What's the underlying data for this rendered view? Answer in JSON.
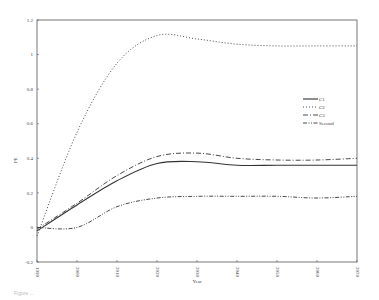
{
  "chart_data": {
    "type": "line",
    "title": "",
    "xlabel": "Year",
    "ylabel": "PE",
    "x": [
      1990,
      2000,
      2010,
      2020,
      2030,
      2040,
      2050,
      2060,
      2070
    ],
    "xlim": [
      1990,
      2070
    ],
    "ylim": [
      -0.2,
      1.2
    ],
    "x_ticks": [
      "1990",
      "2000",
      "2010",
      "2020",
      "2030",
      "2040",
      "2050",
      "2060",
      "2070"
    ],
    "y_ticks": [
      "-0.2",
      "0",
      "0.2",
      "0.4",
      "0.6",
      "0.8",
      "1",
      "1.2"
    ],
    "y_tick_values": [
      -0.2,
      0,
      0.2,
      0.4,
      0.6,
      0.8,
      1.0,
      1.2
    ],
    "grid": false,
    "legend_position": "right-middle",
    "series": [
      {
        "name": "C1",
        "style": "solid",
        "values": [
          -0.02,
          0.13,
          0.27,
          0.37,
          0.38,
          0.36,
          0.36,
          0.36,
          0.36
        ]
      },
      {
        "name": "C2",
        "style": "dotted",
        "values": [
          -0.05,
          0.55,
          0.95,
          1.11,
          1.09,
          1.06,
          1.05,
          1.05,
          1.05
        ]
      },
      {
        "name": "C3",
        "style": "dashdot",
        "values": [
          -0.01,
          0.14,
          0.3,
          0.41,
          0.43,
          0.4,
          0.39,
          0.39,
          0.4
        ]
      },
      {
        "name": "Second",
        "style": "dashdotdot",
        "values": [
          0.0,
          0.0,
          0.12,
          0.17,
          0.18,
          0.18,
          0.18,
          0.17,
          0.18
        ]
      }
    ]
  },
  "caption": "Figure ..."
}
